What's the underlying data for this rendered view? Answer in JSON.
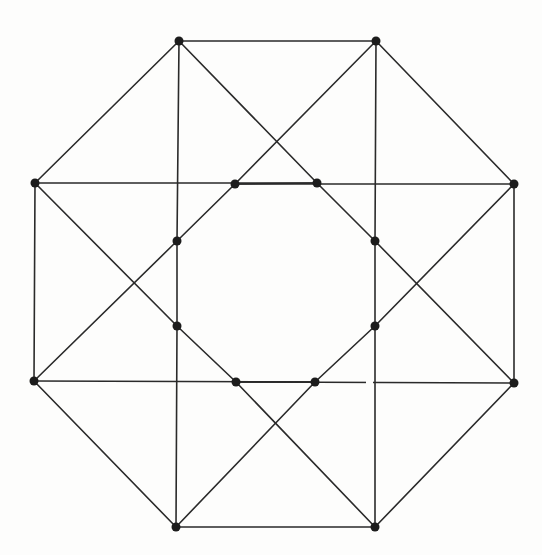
{
  "diagram": {
    "type": "graph",
    "canvas": {
      "width": 542,
      "height": 555
    },
    "colors": {
      "background": "#fdfdfc",
      "edge": "#2a2a2a",
      "vertex": "#1c1c1c"
    },
    "vertex_radius": 4.5,
    "vertices": [
      {
        "id": "TL",
        "x": 179,
        "y": 41
      },
      {
        "id": "TR",
        "x": 376,
        "y": 41
      },
      {
        "id": "LU",
        "x": 35,
        "y": 183
      },
      {
        "id": "RU",
        "x": 514,
        "y": 184
      },
      {
        "id": "LL",
        "x": 34,
        "y": 381
      },
      {
        "id": "RL",
        "x": 514,
        "y": 383
      },
      {
        "id": "BL",
        "x": 176,
        "y": 527
      },
      {
        "id": "BR",
        "x": 375,
        "y": 527
      },
      {
        "id": "ITL",
        "x": 235,
        "y": 184
      },
      {
        "id": "ITR",
        "x": 317,
        "y": 183
      },
      {
        "id": "IMUL",
        "x": 177,
        "y": 241
      },
      {
        "id": "IMUR",
        "x": 375,
        "y": 241
      },
      {
        "id": "IMLL",
        "x": 177,
        "y": 326
      },
      {
        "id": "IMLR",
        "x": 375,
        "y": 326
      },
      {
        "id": "IBL",
        "x": 236,
        "y": 382
      },
      {
        "id": "IBR",
        "x": 315,
        "y": 382
      }
    ],
    "edges": [
      [
        "TL",
        "TR"
      ],
      [
        "TR",
        "RU"
      ],
      [
        "RU",
        "RL"
      ],
      [
        "RL",
        "BR"
      ],
      [
        "BR",
        "BL"
      ],
      [
        "BL",
        "LL"
      ],
      [
        "LL",
        "LU"
      ],
      [
        "LU",
        "TL"
      ],
      [
        "ITL",
        "ITR"
      ],
      [
        "ITR",
        "IMUR"
      ],
      [
        "IMUR",
        "IMLR"
      ],
      [
        "IMLR",
        "IBR"
      ],
      [
        "IBR",
        "IBL"
      ],
      [
        "IBL",
        "IMLL"
      ],
      [
        "IMLL",
        "IMUL"
      ],
      [
        "IMUL",
        "ITL"
      ],
      [
        "TL",
        "IMUL"
      ],
      [
        "TL",
        "ITR"
      ],
      [
        "TR",
        "IMUR"
      ],
      [
        "TR",
        "ITL"
      ],
      [
        "LU",
        "ITR"
      ],
      [
        "LU",
        "IMLL"
      ],
      [
        "RU",
        "ITL"
      ],
      [
        "RU",
        "IMLR"
      ],
      [
        "LL",
        "IBR"
      ],
      [
        "LL",
        "IMUL"
      ],
      [
        "RL",
        "IBL"
      ],
      [
        "RL",
        "IMUR"
      ],
      [
        "BL",
        "IMLL"
      ],
      [
        "BL",
        "IBR"
      ],
      [
        "BR",
        "IMLR"
      ],
      [
        "BR",
        "IBL"
      ]
    ],
    "line_breaks": [
      {
        "from": [
          366,
          382
        ],
        "to": [
          373,
          382
        ]
      }
    ]
  }
}
